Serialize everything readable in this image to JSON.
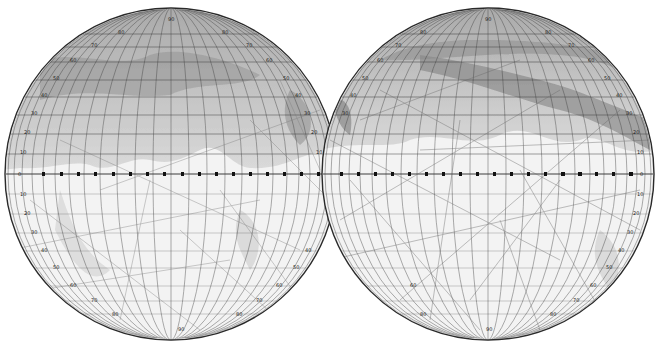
{
  "map": {
    "title": "",
    "subject": "Mars areographic chart in two hemispheres",
    "colors": {
      "background": "#ffffff",
      "globe_fill": "#f4f4f4",
      "north_shade": "#b8b8b8",
      "dark_sea": "#8e8e8e",
      "grid_line": "#3a3a3a",
      "canal_line": "#7a7a7a",
      "rim": "#2a2a2a"
    },
    "hemispheres": [
      {
        "id": "west",
        "cx": 171,
        "cy": 174,
        "r": 166,
        "north_labels": [
          "90",
          "80",
          "70",
          "60",
          "50",
          "40",
          "30",
          "20",
          "10"
        ],
        "south_labels": [
          "10",
          "20",
          "30",
          "40",
          "50",
          "60",
          "70",
          "80",
          "90"
        ],
        "equator_labels": [
          "180",
          "190",
          "200",
          "210",
          "220",
          "230",
          "240",
          "250",
          "260",
          "270",
          "280",
          "290",
          "300",
          "310",
          "320",
          "330",
          "340",
          "350",
          "0"
        ],
        "equator_label": "0"
      },
      {
        "id": "east",
        "cx": 488,
        "cy": 174,
        "r": 166,
        "north_labels": [
          "90",
          "80",
          "70",
          "60",
          "50",
          "40",
          "30",
          "20",
          "10"
        ],
        "south_labels": [
          "10",
          "20",
          "30",
          "40",
          "50",
          "60",
          "70",
          "80",
          "90"
        ],
        "equator_labels": [
          "0",
          "10",
          "20",
          "30",
          "40",
          "50",
          "60",
          "70",
          "80",
          "90",
          "100",
          "110",
          "120",
          "130",
          "140",
          "150",
          "160",
          "170",
          "180"
        ],
        "equator_label": "0"
      }
    ]
  }
}
